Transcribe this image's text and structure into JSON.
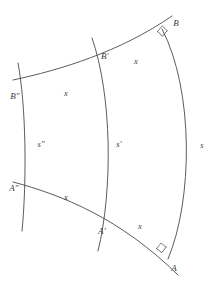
{
  "figure": {
    "stroke_color": "#4a4a4a",
    "background_color": "#ffffff",
    "labels": {
      "point_a": "A",
      "point_a_prime": "A′",
      "point_a_double_prime": "A″",
      "point_b": "B",
      "point_b_prime": "B′",
      "point_b_double_prime": "B″",
      "arc_s": "s",
      "arc_s_prime": "s′",
      "arc_s_double_prime": "s″",
      "segment_x_top_right": "x",
      "segment_x_top_left": "x",
      "segment_x_bottom_right": "x",
      "segment_x_bottom_left": "x"
    },
    "geometry": {
      "curves": [
        {
          "name": "arc-s-double-prime",
          "label": "s″",
          "path": "M 18 63 C 26 105, 27 180, 22 231"
        },
        {
          "name": "arc-s-prime",
          "label": "s′",
          "path": "M 92 38 C 112 95, 113 190, 98 251"
        },
        {
          "name": "arc-s",
          "label": "s",
          "path": "M 162 29 C 194 90, 193 200, 168 259"
        }
      ],
      "transversals": [
        {
          "name": "transversal-top",
          "from": "B″",
          "through": "B′",
          "to": "B",
          "path": "M 13 80 C 60 70, 120 52, 172 16"
        },
        {
          "name": "transversal-bottom",
          "from": "A″",
          "through": "A′",
          "to": "A",
          "path": "M 13 182 C 62 195, 120 218, 178 275"
        }
      ],
      "right_angles": [
        {
          "name": "right-angle-at-b",
          "path": "M 158 32 L 163 36 L 167 31"
        },
        {
          "name": "right-angle-at-a",
          "path": "M 157 248 L 162 252 L 166 247"
        }
      ],
      "label_positions": {
        "point_b": {
          "x": 176,
          "y": 23
        },
        "point_b_prime": {
          "x": 105,
          "y": 56
        },
        "point_b_double_prime": {
          "x": 15,
          "y": 96
        },
        "point_a": {
          "x": 174,
          "y": 268
        },
        "point_a_prime": {
          "x": 102,
          "y": 231
        },
        "point_a_double_prime": {
          "x": 14,
          "y": 188
        },
        "arc_s": {
          "x": 202,
          "y": 145
        },
        "arc_s_prime": {
          "x": 119,
          "y": 144
        },
        "arc_s_double_prime": {
          "x": 41,
          "y": 144
        },
        "segment_x_top_right": {
          "x": 136,
          "y": 61
        },
        "segment_x_top_left": {
          "x": 66,
          "y": 93
        },
        "segment_x_bottom_right": {
          "x": 140,
          "y": 226
        },
        "segment_x_bottom_left": {
          "x": 66,
          "y": 197
        }
      }
    }
  }
}
